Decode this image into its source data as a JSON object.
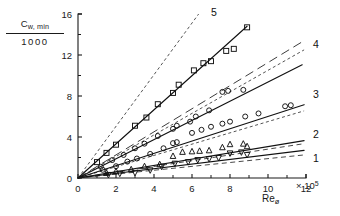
{
  "figure": {
    "ylabel_numerator": "C",
    "ylabel_numerator_sub": "w, min",
    "ylabel_denominator": "1000",
    "xlabel_base": "Re",
    "xlabel_sub": "ø",
    "x_exponent_text": "× 10",
    "x_exponent_power": "5"
  },
  "axes": {
    "x_ticks": [
      "0",
      "2",
      "4",
      "6",
      "8",
      "10",
      "12"
    ],
    "y_ticks": [
      "0",
      "4",
      "8",
      "12",
      "16"
    ],
    "x_minor": [
      1,
      3,
      5,
      7,
      9,
      11
    ],
    "y_minor": [
      2,
      6,
      10,
      14
    ],
    "xlim": [
      0,
      12
    ],
    "ylim": [
      0,
      16
    ]
  },
  "curve_labels": [
    {
      "id": "5",
      "text": "5"
    },
    {
      "id": "4",
      "text": "4"
    },
    {
      "id": "3",
      "text": "3"
    },
    {
      "id": "2",
      "text": "2"
    },
    {
      "id": "1",
      "text": "1"
    }
  ],
  "chart_data": {
    "type": "scatter",
    "title": "",
    "xlabel": "Reø",
    "ylabel": "Cw,min / 1000",
    "xlim": [
      0,
      12
    ],
    "ylim": [
      0,
      16
    ],
    "x_tick_values": [
      0,
      2,
      4,
      6,
      8,
      10,
      12
    ],
    "y_tick_values": [
      0,
      4,
      8,
      12,
      16
    ],
    "x_scale_note": "x values in units of 10^5",
    "grid": false,
    "legend": "curve numbers 1-5 at right ends of lines",
    "series": [
      {
        "name": "5",
        "label": "5",
        "line": "solid",
        "marker": "open-square",
        "fit_slope": 1.66,
        "fit_intercept": 0.0,
        "x_fit": [
          0,
          8.9
        ],
        "y_fit": [
          0,
          14.8
        ],
        "x": [
          1.0,
          1.5,
          2.0,
          3.0,
          3.6,
          4.2,
          5.0,
          5.3,
          6.1,
          6.6,
          7.0,
          7.8,
          8.2,
          8.9
        ],
        "y": [
          1.55,
          2.45,
          3.25,
          5.1,
          5.9,
          7.2,
          8.3,
          9.1,
          10.5,
          11.2,
          11.4,
          12.4,
          12.6,
          14.7
        ]
      },
      {
        "name": "4",
        "label": "4",
        "line": "solid",
        "marker": "open-circle",
        "fit_slope": 0.935,
        "fit_intercept": 0.0,
        "x_fit": [
          0,
          11.8
        ],
        "y_fit": [
          0,
          11.05
        ],
        "x": [
          1.2,
          1.8,
          2.4,
          3.0,
          3.5,
          4.2,
          5.0,
          5.2,
          5.9,
          6.2,
          6.9,
          7.6,
          7.9,
          8.7
        ],
        "y": [
          1.1,
          1.75,
          2.25,
          2.9,
          3.35,
          4.1,
          4.8,
          5.1,
          5.5,
          6.0,
          6.6,
          8.4,
          8.5,
          8.6
        ]
      },
      {
        "name": "3",
        "line": "solid",
        "label": "3",
        "marker": "open-circle",
        "fit_slope": 0.6,
        "fit_intercept": 0.0,
        "x_fit": [
          0,
          11.9
        ],
        "y_fit": [
          0,
          7.15
        ],
        "x": [
          1.3,
          2.0,
          2.6,
          3.1,
          3.8,
          4.5,
          5.0,
          5.2,
          6.0,
          6.5,
          7.0,
          7.6,
          8.0,
          8.8,
          9.5,
          10.9,
          11.2
        ],
        "y": [
          0.8,
          1.15,
          1.6,
          1.9,
          2.35,
          2.9,
          3.4,
          3.5,
          4.4,
          4.7,
          5.0,
          5.3,
          5.5,
          6.0,
          6.3,
          7.0,
          7.1
        ]
      },
      {
        "name": "2",
        "label": "2",
        "line": "solid",
        "marker": "open-triangle-up",
        "fit_slope": 0.305,
        "fit_intercept": 0.0,
        "x_fit": [
          0,
          11.9
        ],
        "y_fit": [
          0,
          3.65
        ],
        "x": [
          1.5,
          2.0,
          2.8,
          3.5,
          4.3,
          5.0,
          5.5,
          6.0,
          6.4,
          6.9,
          7.6,
          8.0,
          8.7,
          8.9
        ],
        "y": [
          0.5,
          0.65,
          0.85,
          1.15,
          1.35,
          2.15,
          2.55,
          2.6,
          2.65,
          2.7,
          3.0,
          3.3,
          3.35,
          3.1
        ]
      },
      {
        "name": "1",
        "label": "1",
        "line": "solid",
        "marker": "filled-triangle-down",
        "fit_slope": 0.225,
        "fit_intercept": 0.0,
        "x_fit": [
          0,
          11.9
        ],
        "y_fit": [
          0,
          2.7
        ],
        "x": [
          1.6,
          2.2,
          3.0,
          3.8,
          4.4,
          5.1,
          5.8,
          6.3,
          6.9,
          7.4,
          8.0,
          8.6,
          8.9
        ],
        "y": [
          0.3,
          0.42,
          0.5,
          0.75,
          1.1,
          1.4,
          1.55,
          1.75,
          1.85,
          1.95,
          2.4,
          2.5,
          2.25
        ]
      }
    ],
    "reference_lines": [
      {
        "name": "ref-steepest",
        "style": "dashed-fine",
        "x": [
          0,
          6.35
        ],
        "y": [
          0,
          16.0
        ]
      },
      {
        "name": "ref-long-dash-upper",
        "style": "dashed-long",
        "x": [
          0,
          11.9
        ],
        "y": [
          0,
          13.4
        ]
      },
      {
        "name": "ref-dashed-mid-upper",
        "style": "dashed-fine",
        "x": [
          0,
          11.9
        ],
        "y": [
          0,
          12.5
        ]
      },
      {
        "name": "ref-dashed-3",
        "style": "dashed-fine",
        "x": [
          0,
          11.9
        ],
        "y": [
          0,
          6.55
        ]
      },
      {
        "name": "ref-dashed-2",
        "style": "dashed",
        "x": [
          0,
          11.9
        ],
        "y": [
          0,
          3.35
        ]
      },
      {
        "name": "ref-dashed-1",
        "style": "dashed",
        "x": [
          0,
          11.9
        ],
        "y": [
          0,
          2.25
        ]
      }
    ]
  }
}
